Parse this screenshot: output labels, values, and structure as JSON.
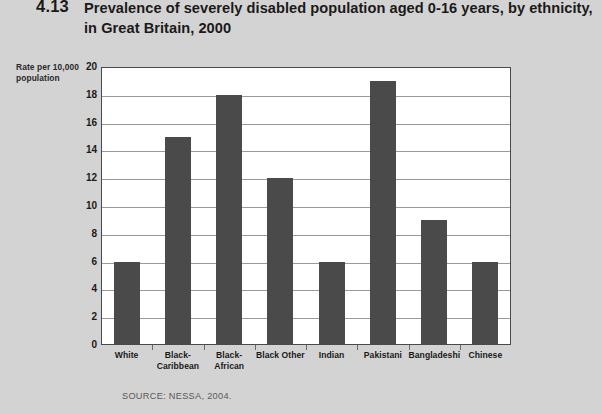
{
  "figure": {
    "number": "4.13",
    "title": "Prevalence of severely disabled population aged 0-16 years, by ethnicity, in Great Britain, 2000",
    "source": "SOURCE: NESSA, 2004."
  },
  "colors": {
    "page_background": "#d3d3d3",
    "plot_background": "#ffffff",
    "bar": "#4a4a4a",
    "gridline": "#9a9a9a",
    "axis": "#4a4a4a",
    "text": "#1a1a1a",
    "source_text": "#5a5a5a"
  },
  "chart_data": {
    "type": "bar",
    "title": "Prevalence of severely disabled population aged 0-16 years, by ethnicity, in Great Britain, 2000",
    "subtitle": "",
    "xlabel": "",
    "ylabel": "Rate per 10,000 population",
    "categories": [
      "White",
      "Black-Caribbean",
      "Black-African",
      "Black Other",
      "Indian",
      "Pakistani",
      "Bangladeshi",
      "Chinese"
    ],
    "category_lines": [
      [
        "White"
      ],
      [
        "Black-",
        "Caribbean"
      ],
      [
        "Black-",
        "African"
      ],
      [
        "Black Other"
      ],
      [
        "Indian"
      ],
      [
        "Pakistani"
      ],
      [
        "Bangladeshi"
      ],
      [
        "Chinese"
      ]
    ],
    "values": [
      6,
      15,
      18,
      12,
      6,
      19,
      9,
      6
    ],
    "ylim": [
      0,
      20
    ],
    "ytick_step": 2,
    "yticks": [
      0,
      2,
      4,
      6,
      8,
      10,
      12,
      14,
      16,
      18,
      20
    ],
    "ytick_labels": [
      "0",
      "2",
      "4",
      "6",
      "8",
      "10",
      "12",
      "14",
      "16",
      "18",
      "20"
    ],
    "grid": true,
    "grid_axis": "y",
    "legend": false,
    "legend_position": "none"
  }
}
